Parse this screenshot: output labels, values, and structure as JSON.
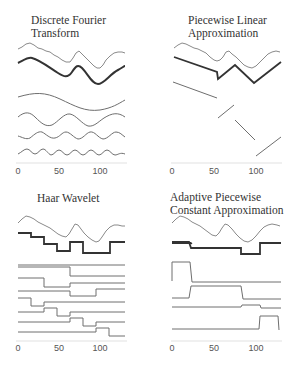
{
  "figure": {
    "panels": [
      {
        "id": "dft",
        "title_line1": "Discrete Fourier",
        "title_line2": "Transform",
        "x_ticks": [
          "0",
          "50",
          "100"
        ]
      },
      {
        "id": "pla",
        "title_line1": "Piecewise Linear",
        "title_line2": "Approximation",
        "x_ticks": [
          "0",
          "50",
          "100"
        ]
      },
      {
        "id": "haar",
        "title_line1": "Haar Wavelet",
        "title_line2": "",
        "x_ticks": [
          "0",
          "50",
          "100"
        ]
      },
      {
        "id": "apca",
        "title_line1": "Adaptive Piecewise",
        "title_line2": "Constant Approximation",
        "x_ticks": [
          "0",
          "50",
          "100"
        ]
      }
    ],
    "colors": {
      "original_series": "#8a8a8a",
      "approximation": "#333333",
      "basis": "#6e6e6e",
      "axis": "#cccccc"
    },
    "x_range": [
      0,
      128
    ]
  }
}
